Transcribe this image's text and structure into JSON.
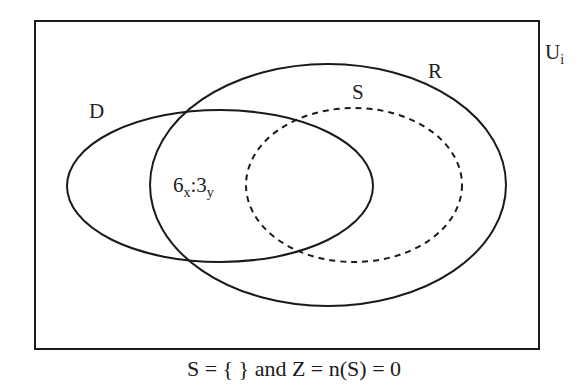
{
  "diagram": {
    "type": "venn",
    "universe": {
      "label": "U",
      "subscript": "i"
    },
    "sets": [
      {
        "id": "D",
        "label": "D",
        "style": "solid"
      },
      {
        "id": "R",
        "label": "R",
        "style": "solid"
      },
      {
        "id": "S",
        "label": "S",
        "style": "dashed"
      }
    ],
    "region_annotation": {
      "main1": "6",
      "sub1": "x",
      "sep": ":",
      "main2": "3",
      "sub2": "y",
      "region": "D ∩ R (outside S)"
    },
    "caption": "S = { } and Z = n(S) = 0"
  },
  "colors": {
    "stroke": "#1a1a1a",
    "background": "#ffffff"
  }
}
